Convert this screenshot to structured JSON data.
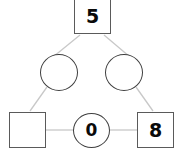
{
  "diagram": {
    "canvas": {
      "width": 182,
      "height": 151,
      "background": "#ffffff"
    },
    "style": {
      "edge_color": "#c8c8c8",
      "square_stroke": "#5a5a5a",
      "circle_stroke": "#3f3f3f",
      "node_fill": "#ffffff",
      "label_color": "#0a0a0a"
    },
    "nodes": [
      {
        "id": "top",
        "shape": "square",
        "label": "5",
        "filled": true,
        "cx": 92.5,
        "cy": 16.5
      },
      {
        "id": "mid-left",
        "shape": "circle",
        "label": "",
        "filled": false,
        "cx": 59,
        "cy": 72.5
      },
      {
        "id": "mid-right",
        "shape": "circle",
        "label": "",
        "filled": false,
        "cx": 124,
        "cy": 72.5
      },
      {
        "id": "bottom-left",
        "shape": "square",
        "label": "",
        "filled": false,
        "cx": 27.5,
        "cy": 130
      },
      {
        "id": "bottom-mid",
        "shape": "circle",
        "label": "0",
        "filled": true,
        "cx": 91.5,
        "cy": 130.5
      },
      {
        "id": "bottom-right",
        "shape": "square",
        "label": "8",
        "filled": true,
        "cx": 155.5,
        "cy": 130
      }
    ],
    "edges": [
      {
        "id": "edge-top-to-mid-left",
        "from": "top",
        "to": "mid-left",
        "x1": 80,
        "y1": 35,
        "x2": 53,
        "y2": 57
      },
      {
        "id": "edge-top-to-mid-right",
        "from": "top",
        "to": "mid-right",
        "x1": 104,
        "y1": 35,
        "x2": 130,
        "y2": 57
      },
      {
        "id": "edge-mid-left-to-bottom-left",
        "from": "mid-left",
        "to": "bottom-left",
        "x1": 47,
        "y1": 87,
        "x2": 30,
        "y2": 111
      },
      {
        "id": "edge-mid-right-to-bottom-right",
        "from": "mid-right",
        "to": "bottom-right",
        "x1": 136,
        "y1": 87,
        "x2": 153,
        "y2": 111
      },
      {
        "id": "edge-bottom-left-to-bottom-mid",
        "from": "bottom-left",
        "to": "bottom-mid",
        "x1": 46,
        "y1": 130,
        "x2": 73,
        "y2": 130
      },
      {
        "id": "edge-bottom-mid-to-bottom-right",
        "from": "bottom-mid",
        "to": "bottom-right",
        "x1": 110,
        "y1": 130,
        "x2": 137,
        "y2": 130
      }
    ]
  }
}
